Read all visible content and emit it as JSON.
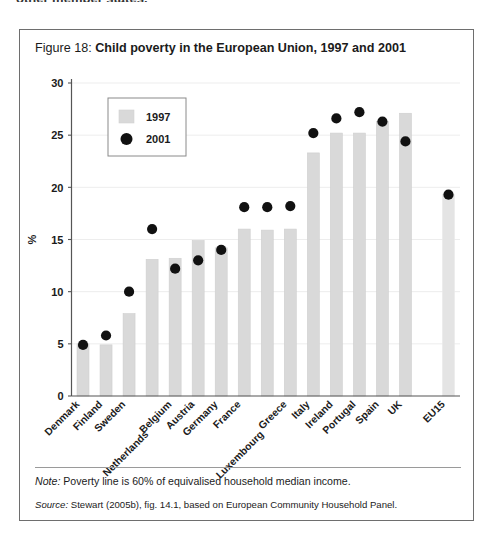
{
  "page": {
    "top_running_text": "other member states."
  },
  "figure": {
    "label": "Figure 18:",
    "title": "Child poverty in the European Union, 1997 and 2001",
    "note_prefix": "Note:",
    "note_text": " Poverty line is 60% of equivalised household median income.",
    "source_prefix": "Source:",
    "source_text": " Stewart (2005b), fig. 14.1, based on European Community Household Panel."
  },
  "colors": {
    "bar_1997": "#d9d9d9",
    "bar_1997_edge": "#cfcfcf",
    "dot_2001": "#111111",
    "axis": "#555555",
    "gridline": "#ededed",
    "frame": "#6e6e6e",
    "text": "#1b1b1b"
  },
  "chart_data": {
    "type": "bar",
    "title": "Child poverty in the European Union, 1997 and 2001",
    "subtitle": "",
    "xlabel": "",
    "ylabel": "%",
    "ylim": [
      0,
      30
    ],
    "yticks": [
      0,
      5,
      10,
      15,
      20,
      25,
      30
    ],
    "ytick_labels": [
      "0",
      "5",
      "10",
      "15",
      "20",
      "25",
      "30"
    ],
    "grid": true,
    "grid_axis": "y",
    "legend_position": "upper-left-inside",
    "categories": [
      "Denmark",
      "Finland",
      "Sweden",
      "Netherlands",
      "Belgium",
      "Austria",
      "Germany",
      "France",
      "Luxembourg",
      "Greece",
      "Italy",
      "Ireland",
      "Portugal",
      "Spain",
      "UK",
      "EU15"
    ],
    "series": [
      {
        "name": "1997",
        "marker": "bar",
        "color": "#d9d9d9",
        "values": [
          5.0,
          4.9,
          7.9,
          13.1,
          13.2,
          14.9,
          14.2,
          16.0,
          15.9,
          16.0,
          23.3,
          25.2,
          25.2,
          26.3,
          27.1,
          19.3
        ]
      },
      {
        "name": "2001",
        "marker": "dot",
        "color": "#111111",
        "values": [
          4.9,
          5.8,
          10.0,
          16.0,
          12.2,
          13.0,
          14.0,
          18.1,
          18.1,
          18.2,
          25.2,
          26.6,
          27.2,
          26.3,
          24.4,
          19.3
        ]
      }
    ],
    "legend": [
      {
        "label": "1997",
        "marker": "square",
        "color": "#d9d9d9"
      },
      {
        "label": "2001",
        "marker": "circle",
        "color": "#111111"
      }
    ]
  }
}
